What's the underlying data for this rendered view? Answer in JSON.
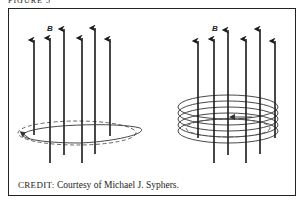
{
  "figure": {
    "header_partial": "FIGURE 5",
    "credit_label": "CREDIT:",
    "credit_text": " Courtesy of Michael J. Syphers.",
    "panels": [
      {
        "id": "left",
        "field_label": "B",
        "description": "Six upward magnetic field arrows passing through a single current loop (solid front, dashed back) with arrow indicating direction"
      },
      {
        "id": "right",
        "field_label": "B",
        "description": "Six upward magnetic field arrows passing through a multi-turn coil of five loops with inner dashed loop and direction arrow"
      }
    ]
  },
  "colors": {
    "line": "#1a1a1a",
    "dashed": "#555555",
    "border": "#222222"
  }
}
